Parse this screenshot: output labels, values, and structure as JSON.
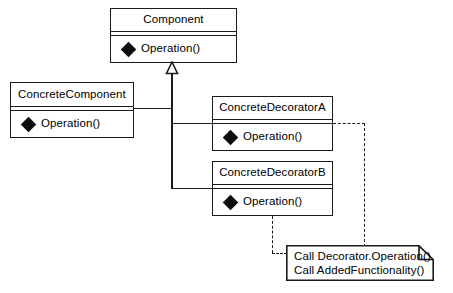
{
  "diagram": {
    "type": "uml-class-diagram",
    "colors": {
      "stroke": "#1a1a1a",
      "fill": "#ffffff",
      "text": "#000000",
      "bullet": "#0d0d0d"
    }
  },
  "classes": [
    {
      "id": "component",
      "name": "Component",
      "operations": [
        {
          "bullet": "black-diamond-icon",
          "label": "Operation()"
        }
      ]
    },
    {
      "id": "concrete_component",
      "name": "ConcreteComponent",
      "operations": [
        {
          "bullet": "black-diamond-icon",
          "label": "Operation()"
        }
      ]
    },
    {
      "id": "concrete_decorator_a",
      "name": "ConcreteDecoratorA",
      "operations": [
        {
          "bullet": "black-diamond-icon",
          "label": "Operation()"
        }
      ]
    },
    {
      "id": "concrete_decorator_b",
      "name": "ConcreteDecoratorB",
      "operations": [
        {
          "bullet": "black-diamond-icon",
          "label": "Operation()"
        }
      ]
    }
  ],
  "note": {
    "id": "decorator-note",
    "lines": [
      "Call Decorator.Operation()",
      "Call AddedFunctionality()"
    ],
    "line1": "Call Decorator.Operation()",
    "line2": "Call AddedFunctionality()"
  },
  "relations": [
    {
      "from": "concrete_component",
      "to": "component",
      "type": "generalization"
    },
    {
      "from": "concrete_decorator_a",
      "to": "component",
      "type": "generalization"
    },
    {
      "from": "concrete_decorator_b",
      "to": "component",
      "type": "generalization"
    },
    {
      "from": "concrete_decorator_a",
      "to": "decorator-note",
      "type": "dependency"
    },
    {
      "from": "concrete_decorator_b",
      "to": "decorator-note",
      "type": "dependency"
    }
  ]
}
